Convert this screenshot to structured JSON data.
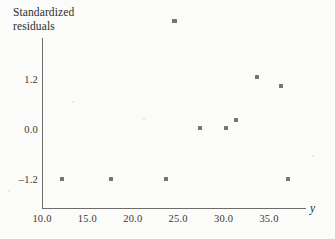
{
  "chart_data": {
    "type": "scatter",
    "title": "",
    "ylabel": "Standardized\nresiduals",
    "xlabel": "y",
    "xlim": [
      8.5,
      37.6
    ],
    "ylim": [
      -1.85,
      2.95
    ],
    "grid": false,
    "legend": null,
    "xticks": [
      "10.0",
      "15.0",
      "20.0",
      "25.0",
      "30.0",
      "35.0"
    ],
    "xtick_values": [
      10.0,
      15.0,
      20.0,
      25.0,
      30.0,
      35.0
    ],
    "yticks": [
      "1.2",
      "0.0",
      "–1.2"
    ],
    "ytick_values": [
      1.2,
      0.0,
      -1.2
    ],
    "marker": "square",
    "marker_color": "#77746f",
    "points": [
      {
        "x": 12.2,
        "y": -1.2
      },
      {
        "x": 17.6,
        "y": -1.2
      },
      {
        "x": 23.7,
        "y": -1.2
      },
      {
        "x": 37.1,
        "y": -1.2
      },
      {
        "x": 24.6,
        "y": 2.6
      },
      {
        "x": 27.4,
        "y": 0.02
      },
      {
        "x": 30.3,
        "y": 0.03
      },
      {
        "x": 31.4,
        "y": 0.22
      },
      {
        "x": 33.7,
        "y": 1.25
      },
      {
        "x": 36.3,
        "y": 1.03
      }
    ]
  },
  "axis_color": "#6e6c6a",
  "background_color": "#fbfbf9"
}
